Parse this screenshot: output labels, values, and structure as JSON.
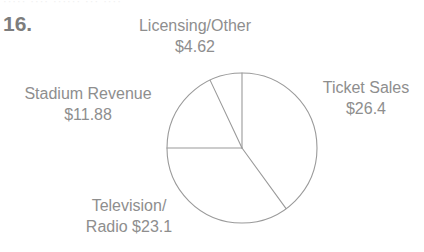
{
  "page": {
    "item_number": "16.",
    "faint_cutoff_text": "·····  ····  ······  ···  ····"
  },
  "colors": {
    "text": "#8e8e8e",
    "number": "#7d7d7d",
    "stroke": "#9a9a9a",
    "background": "#ffffff"
  },
  "labels": {
    "licensing": {
      "name": "Licensing/Other",
      "value": "$4.62"
    },
    "ticket": {
      "name": "Ticket Sales",
      "value": "$26.4"
    },
    "stadium": {
      "name": "Stadium Revenue",
      "value": "$11.88"
    },
    "television": {
      "name": "Television/",
      "value": "Radio $23.1"
    }
  },
  "chart_data": {
    "type": "pie",
    "title": "",
    "unit": "$ (millions)",
    "total": 66.0,
    "legend": "labels-outside",
    "start_angle_deg": 0,
    "direction": "clockwise",
    "center": {
      "x": 242,
      "y": 148
    },
    "radius": 75,
    "categories": [
      "Ticket Sales",
      "Television/Radio",
      "Stadium Revenue",
      "Licensing/Other"
    ],
    "values": [
      26.4,
      23.1,
      11.88,
      4.62
    ],
    "value_labels": [
      "$26.4",
      "$23.1",
      "$11.88",
      "$4.62"
    ],
    "slices": [
      {
        "label": "Ticket Sales",
        "value": 26.4,
        "value_label": "$26.4",
        "start_deg": 0,
        "end_deg": 144.0,
        "sweep_deg": 144.0
      },
      {
        "label": "Television/Radio",
        "value": 23.1,
        "value_label": "$23.1",
        "start_deg": 144.0,
        "end_deg": 270.0,
        "sweep_deg": 126.0
      },
      {
        "label": "Stadium Revenue",
        "value": 11.88,
        "value_label": "$11.88",
        "start_deg": 270.0,
        "end_deg": 334.8,
        "sweep_deg": 64.8
      },
      {
        "label": "Licensing/Other",
        "value": 4.62,
        "value_label": "$4.62",
        "start_deg": 334.8,
        "end_deg": 360.0,
        "sweep_deg": 25.2
      }
    ]
  }
}
